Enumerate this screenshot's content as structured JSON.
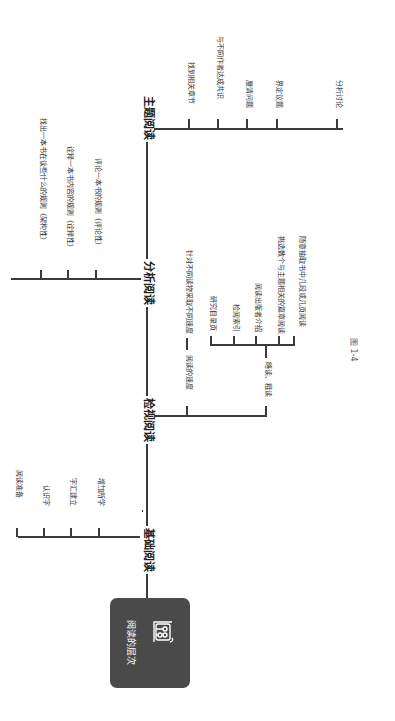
{
  "root": {
    "label": "阅读的层次",
    "icon": "reading-books-icon"
  },
  "levels": [
    {
      "label": "基础阅读",
      "children": [
        "阅读准备",
        "认识字",
        "字汇建立",
        "增加所学"
      ]
    },
    {
      "label": "检视阅读",
      "children": [
        {
          "label": "阅读的速度",
          "detail": "针对不同读物采取不同速度"
        },
        {
          "label": "略读、粗读",
          "children": [
            "研究目录页",
            "检阅索引",
            "阅读出版者介绍",
            "挑选数个与主题相关的篇章阅读",
            "随意抽取书中几段或几页阅读"
          ]
        }
      ]
    },
    {
      "label": "分析阅读",
      "children": [
        "找出一本书在谈些什么的规则（架构性）",
        "诠释一本书内容的规则（诠释性）",
        "评论一本书的规则（评论性）"
      ]
    },
    {
      "label": "主题阅读",
      "children": [
        "找到相关章节",
        "与不同作者达成共识",
        "厘清问题",
        "界定议题",
        "分析讨论"
      ]
    }
  ],
  "caption": "图 1-4",
  "colors": {
    "root_bg": "#4a4a4a",
    "line": "#3a3a3a",
    "text": "#333333"
  }
}
